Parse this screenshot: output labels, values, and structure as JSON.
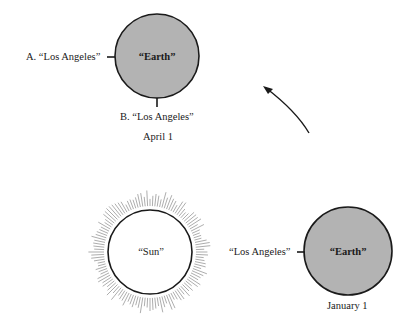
{
  "diagram": {
    "colors": {
      "earth_fill": "#b3b3b3",
      "outline": "#1a1a1a",
      "sun_fill": "#ffffff",
      "rays": "#8a8a8a",
      "background": "#ffffff"
    },
    "earth_april": {
      "label": "“Earth”",
      "marker_a": "A. “Los Angeles”",
      "marker_b": "B. “Los Angeles”",
      "date": "April 1"
    },
    "earth_january": {
      "label": "“Earth”",
      "marker": "“Los Angeles”",
      "date": "January 1"
    },
    "sun": {
      "label": "“Sun”"
    },
    "orbit_arrow": {
      "direction": "counterclockwise",
      "icon": "curved-arrow-icon"
    }
  }
}
